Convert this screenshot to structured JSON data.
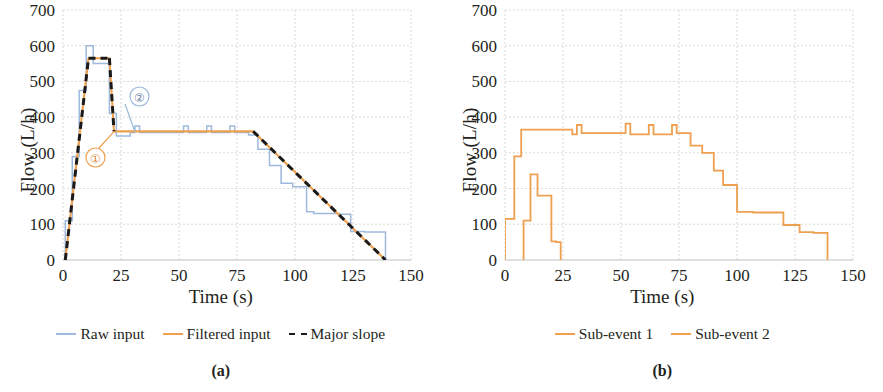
{
  "figure": {
    "panels": [
      {
        "caption": "(a)",
        "axes": {
          "xlabel": "Time (s)",
          "ylabel": "Flow (L/h)",
          "xticks": [
            0,
            25,
            50,
            75,
            100,
            125,
            150
          ],
          "yticks": [
            0,
            100,
            200,
            300,
            400,
            500,
            600,
            700
          ],
          "xlim": [
            0,
            150
          ],
          "ylim": [
            0,
            700
          ],
          "grid": true
        },
        "legend": [
          {
            "label": "Raw input",
            "color": "#9DB9DC",
            "style": "solid"
          },
          {
            "label": "Filtered input",
            "color": "#EDA04F",
            "style": "solid"
          },
          {
            "label": "Major slope",
            "color": "#1A1A1A",
            "style": "dashed"
          }
        ],
        "annotations": [
          {
            "label": "①",
            "color": "#EDA04F",
            "cx": 31,
            "cy": 162,
            "target_x": 76,
            "target_y": 131
          },
          {
            "label": "②",
            "color": "#9DB9DC",
            "cx": 48,
            "cy": 322,
            "target_x": 86,
            "target_y": 132
          }
        ]
      },
      {
        "caption": "(b)",
        "axes": {
          "xlabel": "Time (s)",
          "ylabel": "Flow (L/h)",
          "xticks": [
            0,
            25,
            50,
            75,
            100,
            125,
            150
          ],
          "yticks": [
            0,
            100,
            200,
            300,
            400,
            500,
            600,
            700
          ],
          "xlim": [
            0,
            150
          ],
          "ylim": [
            0,
            700
          ],
          "grid": true
        },
        "legend": [
          {
            "label": "Sub-event 1",
            "color": "#EDA04F",
            "style": "solid"
          },
          {
            "label": "Sub-event 2",
            "color": "#EDA04F",
            "style": "solid"
          }
        ],
        "annotations": []
      }
    ]
  },
  "chart_data": [
    {
      "type": "line",
      "title": "(a)",
      "xlabel": "Time (s)",
      "ylabel": "Flow (L/h)",
      "xlim": [
        0,
        150
      ],
      "ylim": [
        0,
        700
      ],
      "xticks": [
        0,
        25,
        50,
        75,
        100,
        125,
        150
      ],
      "yticks": [
        0,
        100,
        200,
        300,
        400,
        500,
        600,
        700
      ],
      "grid": true,
      "legend_position": "below",
      "series": [
        {
          "name": "Raw input",
          "color": "#9DB9DC",
          "style": "step",
          "x": [
            1,
            1,
            4,
            4,
            7,
            7,
            10,
            10,
            13,
            13,
            20,
            20,
            23,
            23,
            29,
            29,
            31,
            31,
            33,
            33,
            52,
            52,
            54,
            54,
            62,
            62,
            64,
            64,
            72,
            72,
            74,
            74,
            80,
            80,
            84,
            84,
            89,
            89,
            94,
            94,
            99,
            99,
            105,
            105,
            108,
            108,
            119,
            119,
            124,
            124,
            130,
            130,
            139,
            139
          ],
          "y": [
            0,
            110,
            110,
            290,
            290,
            475,
            475,
            600,
            600,
            550,
            550,
            410,
            410,
            347,
            347,
            357,
            357,
            375,
            375,
            357,
            357,
            375,
            375,
            357,
            357,
            375,
            375,
            357,
            357,
            375,
            375,
            357,
            357,
            350,
            350,
            310,
            310,
            265,
            265,
            215,
            215,
            205,
            205,
            135,
            135,
            130,
            130,
            128,
            128,
            80,
            80,
            78,
            78,
            0
          ]
        },
        {
          "name": "Filtered input",
          "color": "#EDA04F",
          "style": "line",
          "x": [
            1,
            11,
            20,
            22,
            82,
            139
          ],
          "y": [
            0,
            565,
            565,
            360,
            360,
            0
          ]
        },
        {
          "name": "Major slope",
          "color": "#1A1A1A",
          "style": "dashed",
          "segments": [
            {
              "x": [
                1,
                11
              ],
              "y": [
                0,
                565
              ]
            },
            {
              "x": [
                11,
                20
              ],
              "y": [
                565,
                565
              ]
            },
            {
              "x": [
                20,
                22
              ],
              "y": [
                565,
                360
              ]
            },
            {
              "x": [
                82,
                139
              ],
              "y": [
                360,
                0
              ]
            }
          ]
        }
      ],
      "annotations": [
        {
          "label": "①",
          "note": "callout marking the filtered-input elbow",
          "color": "#EDA04F"
        },
        {
          "label": "②",
          "note": "callout marking the raw-input step drop",
          "color": "#9DB9DC"
        }
      ]
    },
    {
      "type": "line",
      "title": "(b)",
      "xlabel": "Time (s)",
      "ylabel": "Flow (L/h)",
      "xlim": [
        0,
        150
      ],
      "ylim": [
        0,
        700
      ],
      "xticks": [
        0,
        25,
        50,
        75,
        100,
        125,
        150
      ],
      "yticks": [
        0,
        100,
        200,
        300,
        400,
        500,
        600,
        700
      ],
      "grid": true,
      "legend_position": "below",
      "series": [
        {
          "name": "Sub-event 1",
          "color": "#EDA04F",
          "style": "step",
          "x": [
            0,
            0,
            4,
            4,
            7,
            7,
            29,
            29,
            31,
            31,
            33,
            33,
            52,
            52,
            54,
            54,
            62,
            62,
            64,
            64,
            72,
            72,
            74,
            74,
            80,
            80,
            85,
            85,
            90,
            90,
            94,
            94,
            100,
            100,
            107,
            107,
            120,
            120,
            127,
            127,
            133,
            133,
            139,
            139
          ],
          "y": [
            0,
            115,
            115,
            290,
            290,
            365,
            365,
            352,
            352,
            378,
            378,
            355,
            355,
            382,
            382,
            352,
            352,
            378,
            378,
            352,
            352,
            378,
            378,
            355,
            355,
            320,
            320,
            300,
            300,
            250,
            250,
            210,
            210,
            135,
            135,
            133,
            133,
            98,
            98,
            78,
            78,
            76,
            76,
            0
          ]
        },
        {
          "name": "Sub-event 2",
          "color": "#EDA04F",
          "style": "step",
          "x": [
            8,
            8,
            11,
            11,
            14,
            14,
            17,
            17,
            20,
            20,
            22,
            22,
            24,
            24
          ],
          "y": [
            0,
            110,
            110,
            240,
            240,
            180,
            180,
            180,
            180,
            52,
            52,
            50,
            50,
            0
          ]
        }
      ],
      "annotations": []
    }
  ]
}
